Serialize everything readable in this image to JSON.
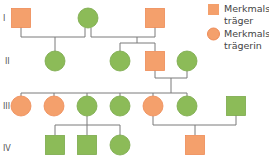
{
  "colors": {
    "affected": "#f4a06c",
    "unaffected": "#8cbb58",
    "affected_stroke": "#ee8a55",
    "unaffected_stroke": "#7aa84a",
    "line": "#7a7a7a"
  },
  "generations": [
    "I",
    "II",
    "III",
    "IV"
  ],
  "legend": [
    {
      "shape": "square",
      "status": "affected",
      "label_line1": "Merkmals-",
      "label_line2": "träger"
    },
    {
      "shape": "circle",
      "status": "affected",
      "label_line1": "Merkmals-",
      "label_line2": "trägerin"
    }
  ],
  "individuals": [
    {
      "id": "I-1",
      "generation": "I",
      "sex": "male",
      "status": "affected"
    },
    {
      "id": "I-2",
      "generation": "I",
      "sex": "female",
      "status": "unaffected"
    },
    {
      "id": "I-3",
      "generation": "I",
      "sex": "male",
      "status": "affected"
    },
    {
      "id": "II-1",
      "generation": "II",
      "sex": "female",
      "status": "unaffected"
    },
    {
      "id": "II-2",
      "generation": "II",
      "sex": "female",
      "status": "unaffected"
    },
    {
      "id": "II-3",
      "generation": "II",
      "sex": "male",
      "status": "affected"
    },
    {
      "id": "II-4",
      "generation": "II",
      "sex": "female",
      "status": "unaffected"
    },
    {
      "id": "III-1",
      "generation": "III",
      "sex": "female",
      "status": "affected"
    },
    {
      "id": "III-2",
      "generation": "III",
      "sex": "female",
      "status": "affected"
    },
    {
      "id": "III-3",
      "generation": "III",
      "sex": "female",
      "status": "unaffected"
    },
    {
      "id": "III-4",
      "generation": "III",
      "sex": "female",
      "status": "unaffected"
    },
    {
      "id": "III-5",
      "generation": "III",
      "sex": "female",
      "status": "affected"
    },
    {
      "id": "III-6",
      "generation": "III",
      "sex": "female",
      "status": "unaffected"
    },
    {
      "id": "III-7",
      "generation": "III",
      "sex": "male",
      "status": "unaffected"
    },
    {
      "id": "IV-1",
      "generation": "IV",
      "sex": "male",
      "status": "unaffected"
    },
    {
      "id": "IV-2",
      "generation": "IV",
      "sex": "male",
      "status": "unaffected"
    },
    {
      "id": "IV-3",
      "generation": "IV",
      "sex": "female",
      "status": "unaffected"
    },
    {
      "id": "IV-4",
      "generation": "IV",
      "sex": "male",
      "status": "affected"
    }
  ],
  "unions": [
    {
      "partners": [
        "I-1",
        "I-2"
      ],
      "children": [
        "II-1"
      ]
    },
    {
      "partners": [
        "I-2",
        "I-3"
      ],
      "children": [
        "II-2",
        "II-3"
      ]
    },
    {
      "partners": [
        "II-3",
        "II-4"
      ],
      "children": [
        "III-1",
        "III-2",
        "III-3",
        "III-4",
        "III-5",
        "III-6"
      ]
    },
    {
      "partners": [
        "III-3"
      ],
      "children": [
        "IV-1",
        "IV-2",
        "IV-3"
      ]
    },
    {
      "partners": [
        "III-5",
        "III-7"
      ],
      "children": [
        "IV-4"
      ]
    }
  ]
}
